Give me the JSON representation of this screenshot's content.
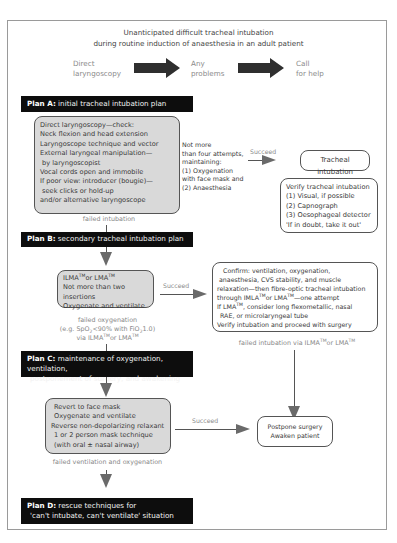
{
  "title": {
    "line1": "Unanticipated difficult tracheal intubation",
    "line2": "during routine induction of anaesthesia in an adult patient"
  },
  "top_flow": [
    {
      "line1": "Direct",
      "line2": "laryngoscopy"
    },
    {
      "line1": "Any",
      "line2": "problems"
    },
    {
      "line1": "Call",
      "line2": "for help"
    }
  ],
  "plan_a": {
    "heading": "Plan A:",
    "text": "initial tracheal intubation plan",
    "box_lines": [
      "Direct laryngoscopy—check:",
      "Neck flexion and head extension",
      "Laryngoscope technique and vector",
      "External laryngeal manipulation—",
      " by laryngoscopist",
      "Vocal cords open and immobile",
      "If poor view: introducer (bougie)—",
      " seek clicks or hold-up",
      "and/or alternative laryngoscope"
    ],
    "note_lines": [
      "Not more",
      "than four attempts,",
      "maintaining:",
      "(1) Oxygenation",
      "with face mask and",
      "(2) Anaesthesia"
    ],
    "succeed_label": "Succeed",
    "success_box": "Tracheal intubation",
    "verify_lines": [
      "Verify tracheal intubation",
      "(1) Visual, if possible",
      "(2) Capnograph",
      "(3) Oesophageal detector",
      "'If in doubt, take it out'"
    ],
    "fail_label": "failed intubation"
  },
  "plan_b": {
    "heading": "Plan B:",
    "text": "secondary tracheal intubation plan",
    "box_line1_a": "ILMA",
    "box_line1_b": "or LMA",
    "tm": "TM",
    "box_line2": "Not more than two insertions",
    "box_line3": "Oxygenate and ventilate",
    "succeed_label": "Succeed",
    "confirm_lines": [
      "Confirm: ventilation, oxygenation,",
      "anaesthesia, CVS stability, and muscle",
      "relaxation—then fibre-optic tracheal intubation"
    ],
    "confirm_line4_a": "through IMLA",
    "confirm_line4_b": "or LMA",
    "confirm_line4_c": "—one attempt",
    "confirm_line5_a": "If LMA",
    "confirm_line5_b": ", consider long flexometallic, nasal",
    "confirm_line6": "RAE, or microlaryngeal tube",
    "confirm_line7": "Verify intubation and proceed with surgery",
    "fail_ox_line1": "failed oxygenation",
    "fail_ox_line2_a": "(e.g. SpO",
    "fail_ox_line2_sub": "2",
    "fail_ox_line2_b": "<90% with FiO",
    "fail_ox_line2_c": "1.0)",
    "fail_ox_line3_a": "via ILMA",
    "fail_ox_line3_b": "or LMA",
    "fail_int_a": "failed intubation via ILMA",
    "fail_int_b": "or LMA"
  },
  "plan_c": {
    "heading": "Plan C:",
    "text_line1": "maintenance of oxygenation, ventilation,",
    "text_line2": "postponement of surgery, and awakening",
    "box_lines": [
      "Revert to face mask",
      "Oxygenate and ventilate",
      "Reverse non-depolarizing relaxant",
      "1 or 2 person mask technique",
      "(with oral ± nasal airway)"
    ],
    "succeed_label": "Succeed",
    "postpone_lines": [
      "Postpone surgery",
      "Awaken patient"
    ],
    "fail_label": "failed ventilation and oxygenation"
  },
  "plan_d": {
    "heading": "Plan D:",
    "text_line1": "rescue techniques for",
    "text_line2": "'can't intubate, can't ventilate' situation"
  }
}
